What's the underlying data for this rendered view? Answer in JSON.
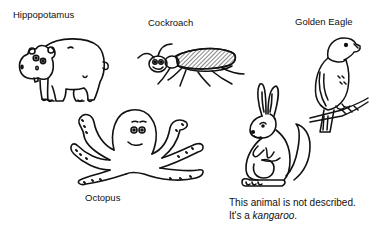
{
  "animals": [
    {
      "id": "hippopotamus",
      "label": "Hippopotamus",
      "described": true
    },
    {
      "id": "cockroach",
      "label": "Cockroach",
      "described": true
    },
    {
      "id": "golden-eagle",
      "label": "Golden Eagle",
      "described": true
    },
    {
      "id": "octopus",
      "label": "Octopus",
      "described": true
    },
    {
      "id": "kangaroo",
      "label": "",
      "described": false
    }
  ],
  "note": {
    "line1": "This animal is not described.",
    "line2_prefix": "It's a ",
    "line2_emphasis": "kangaroo",
    "line2_suffix": "."
  },
  "colors": {
    "ink": "#111111",
    "background": "#ffffff"
  }
}
